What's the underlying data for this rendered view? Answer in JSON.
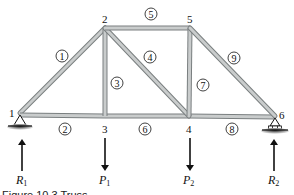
{
  "diagram": {
    "type": "truss",
    "nodes": [
      {
        "id": "1",
        "label": "1",
        "x": 20,
        "y": 113
      },
      {
        "id": "2",
        "label": "2",
        "x": 105,
        "y": 28
      },
      {
        "id": "3",
        "label": "3",
        "x": 105,
        "y": 116
      },
      {
        "id": "4",
        "label": "4",
        "x": 189,
        "y": 116
      },
      {
        "id": "5",
        "label": "5",
        "x": 190,
        "y": 28
      },
      {
        "id": "6",
        "label": "6",
        "x": 275,
        "y": 116
      }
    ],
    "members": [
      {
        "id": "1",
        "label": "1",
        "from": "1",
        "to": "2"
      },
      {
        "id": "2",
        "label": "2",
        "from": "1",
        "to": "3"
      },
      {
        "id": "3",
        "label": "3",
        "from": "2",
        "to": "3"
      },
      {
        "id": "4",
        "label": "4",
        "from": "2",
        "to": "4"
      },
      {
        "id": "5",
        "label": "5",
        "from": "2",
        "to": "5"
      },
      {
        "id": "6",
        "label": "6",
        "from": "3",
        "to": "4"
      },
      {
        "id": "7",
        "label": "7",
        "from": "5",
        "to": "4"
      },
      {
        "id": "8",
        "label": "8",
        "from": "4",
        "to": "6"
      },
      {
        "id": "9",
        "label": "9",
        "from": "5",
        "to": "6"
      }
    ],
    "supports": [
      {
        "node": "1",
        "type": "pin"
      },
      {
        "node": "6",
        "type": "roller"
      }
    ],
    "forces": [
      {
        "id": "R1",
        "symbol": "R",
        "subscript": "1",
        "node": "1",
        "direction": "up"
      },
      {
        "id": "P1",
        "symbol": "P",
        "subscript": "1",
        "node": "3",
        "direction": "down"
      },
      {
        "id": "P2",
        "symbol": "P",
        "subscript": "2",
        "node": "4",
        "direction": "down"
      },
      {
        "id": "R2",
        "symbol": "R",
        "subscript": "2",
        "node": "6",
        "direction": "up"
      }
    ],
    "colors": {
      "member_fill": "#c9cccc",
      "member_edge": "#7a7f80",
      "ink": "#111111"
    }
  },
  "caption": {
    "text": "Figure 10.3  Truss"
  }
}
